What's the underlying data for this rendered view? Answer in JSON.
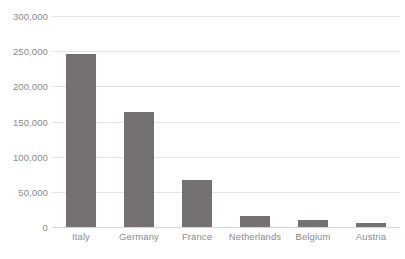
{
  "chart_data": {
    "type": "bar",
    "title": "",
    "subtitle": "",
    "xlabel": "",
    "ylabel": "",
    "categories": [
      "Italy",
      "Germany",
      "France",
      "Netherlands",
      "Belgium",
      "Austria"
    ],
    "values": [
      246000,
      163000,
      67000,
      16000,
      10000,
      5000
    ],
    "ylim": [
      0,
      300000
    ],
    "ytick_values": [
      0,
      50000,
      100000,
      150000,
      200000,
      250000,
      300000
    ],
    "ytick_labels": [
      "0",
      "50,000",
      "100,000",
      "150,000",
      "200,000",
      "250,000",
      "300,000"
    ],
    "grid": true,
    "grid_axis": "y",
    "legend": false,
    "legend_position": "none",
    "bar_color": "#767171",
    "gridline_color": "#e4e4e4",
    "axis_text_color": "#8a8a8a",
    "background_color": "#ffffff"
  }
}
